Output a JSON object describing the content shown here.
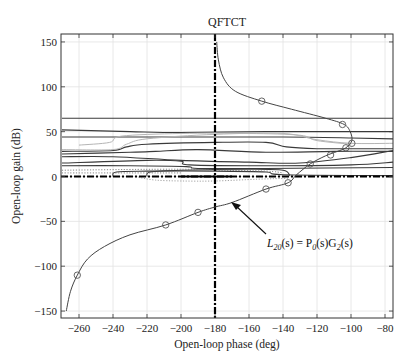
{
  "chart_data": {
    "type": "line",
    "title": "QFTCT",
    "xlabel": "Open-loop phase (deg)",
    "ylabel": "Open-loop gain (dB)",
    "xlim": [
      -270,
      -75
    ],
    "ylim": [
      -157,
      159
    ],
    "xticks": [
      -260,
      -240,
      -220,
      -200,
      -180,
      -160,
      -140,
      -120,
      -100,
      -80
    ],
    "yticks": [
      -150,
      -100,
      -50,
      0,
      50,
      100,
      150
    ],
    "grid": true,
    "reference_lines": {
      "vertical_phase": -180,
      "horizontal_gain": 0
    },
    "series": [
      {
        "name": "L20(s) = P0(s)G2(s)",
        "style": "solid-with-circle-markers",
        "points": [
          [
            -267.5,
            -150
          ],
          [
            -265,
            -128
          ],
          [
            -261,
            -110
          ],
          [
            -255,
            -92
          ],
          [
            -245,
            -78
          ],
          [
            -230,
            -65
          ],
          [
            -209,
            -54
          ],
          [
            -190,
            -40
          ],
          [
            -180,
            -34
          ],
          [
            -170,
            -29
          ],
          [
            -150,
            -14
          ],
          [
            -137,
            -7
          ],
          [
            -132,
            2
          ],
          [
            -124,
            14
          ],
          [
            -115,
            23
          ],
          [
            -108,
            28
          ],
          [
            -103,
            32
          ],
          [
            -99.5,
            40
          ],
          [
            -100.5,
            50
          ],
          [
            -104,
            58
          ],
          [
            -115,
            65
          ],
          [
            -135,
            75
          ],
          [
            -152.5,
            84
          ],
          [
            -168,
            95
          ],
          [
            -175,
            110
          ],
          [
            -178,
            130
          ],
          [
            -179,
            150
          ]
        ],
        "markers": [
          [
            -261,
            -110
          ],
          [
            -209,
            -54
          ],
          [
            -190,
            -40
          ],
          [
            -150,
            -14
          ],
          [
            -137,
            -7
          ],
          [
            -124,
            14
          ],
          [
            -112,
            24
          ],
          [
            -103,
            32
          ],
          [
            -99.5,
            37
          ],
          [
            -105,
            58
          ],
          [
            -152.5,
            84
          ]
        ]
      },
      {
        "name": "bound-1",
        "style": "solid",
        "points": [
          [
            -270,
            65
          ],
          [
            -75,
            65
          ]
        ]
      },
      {
        "name": "bound-2",
        "style": "solid",
        "points": [
          [
            -270,
            52
          ],
          [
            -230,
            50
          ],
          [
            -200,
            49
          ],
          [
            -150,
            50
          ],
          [
            -75,
            50
          ]
        ]
      },
      {
        "name": "bound-3",
        "style": "solid",
        "points": [
          [
            -270,
            44
          ],
          [
            -200,
            44
          ],
          [
            -140,
            44
          ],
          [
            -100,
            43
          ],
          [
            -75,
            42
          ]
        ]
      },
      {
        "name": "bound-4",
        "style": "solid",
        "points": [
          [
            -270,
            28
          ],
          [
            -240,
            29
          ],
          [
            -232,
            33
          ],
          [
            -220,
            36
          ],
          [
            -180,
            38
          ],
          [
            -150,
            38
          ],
          [
            -138,
            33
          ],
          [
            -120,
            31
          ],
          [
            -100,
            31
          ],
          [
            -75,
            31
          ]
        ]
      },
      {
        "name": "bound-5",
        "style": "solid",
        "points": [
          [
            -270,
            25
          ],
          [
            -230,
            27
          ],
          [
            -215,
            28
          ],
          [
            -190,
            30
          ],
          [
            -150,
            27
          ],
          [
            -110,
            28
          ],
          [
            -75,
            28
          ]
        ]
      },
      {
        "name": "bound-6",
        "style": "solid",
        "points": [
          [
            -270,
            22
          ],
          [
            -240,
            22
          ],
          [
            -200,
            18
          ],
          [
            -160,
            16
          ],
          [
            -130,
            15
          ],
          [
            -100,
            21
          ],
          [
            -75,
            29
          ]
        ]
      },
      {
        "name": "bound-7",
        "style": "solid",
        "points": [
          [
            -270,
            15
          ],
          [
            -220,
            18
          ],
          [
            -200,
            17
          ],
          [
            -195,
            13
          ],
          [
            -150,
            12
          ],
          [
            -100,
            13
          ],
          [
            -75,
            16
          ]
        ]
      },
      {
        "name": "bound-8",
        "style": "solid",
        "points": [
          [
            -270,
            12
          ],
          [
            -230,
            12
          ],
          [
            -197,
            11
          ],
          [
            -190,
            9
          ],
          [
            -150,
            9
          ],
          [
            -75,
            10
          ]
        ]
      },
      {
        "name": "bound-9",
        "style": "solid",
        "points": [
          [
            -240,
            0
          ],
          [
            -238,
            5
          ],
          [
            -220,
            6
          ],
          [
            -180,
            6
          ],
          [
            -150,
            5
          ],
          [
            -140,
            2
          ],
          [
            -75,
            1
          ]
        ]
      },
      {
        "name": "bound-10",
        "style": "solid",
        "points": [
          [
            -220,
            0
          ],
          [
            -218,
            5
          ],
          [
            -200,
            7
          ],
          [
            -160,
            8
          ],
          [
            -140,
            7
          ],
          [
            -136,
            1
          ]
        ]
      },
      {
        "name": "bound-11",
        "style": "light",
        "points": [
          [
            -270,
            30
          ],
          [
            -240,
            30
          ],
          [
            -232,
            36
          ],
          [
            -220,
            42
          ],
          [
            -180,
            47
          ],
          [
            -140,
            48
          ],
          [
            -120,
            41
          ],
          [
            -100,
            37
          ],
          [
            -75,
            37
          ]
        ]
      },
      {
        "name": "bound-12",
        "style": "light",
        "points": [
          [
            -260,
            35
          ],
          [
            -242,
            38
          ],
          [
            -235,
            45
          ],
          [
            -200,
            48
          ],
          [
            -160,
            48
          ],
          [
            -130,
            46
          ],
          [
            -120,
            40
          ],
          [
            -100,
            36
          ]
        ]
      },
      {
        "name": "bound-13",
        "style": "dotted",
        "points": [
          [
            -270,
            7
          ],
          [
            -220,
            8
          ],
          [
            -195,
            8
          ],
          [
            -180,
            7
          ],
          [
            -150,
            6
          ],
          [
            -140,
            4
          ]
        ]
      },
      {
        "name": "bound-14",
        "style": "dotted",
        "points": [
          [
            -270,
            4
          ],
          [
            -230,
            4
          ],
          [
            -200,
            4
          ]
        ]
      },
      {
        "name": "bound-15",
        "style": "dotted-light",
        "points": [
          [
            -225,
            -1
          ],
          [
            -215,
            -4
          ],
          [
            -200,
            -5
          ],
          [
            -180,
            -5
          ],
          [
            -155,
            -3
          ],
          [
            -137,
            -2
          ]
        ]
      }
    ],
    "annotations": [
      {
        "text_main": "L",
        "text_sub": "20",
        "text_rest": "(s) = P",
        "text_sub2": "0",
        "text_rest2": "(s)G",
        "text_sub3": "2",
        "text_rest3": "(s)",
        "arrow_from": [
          -150,
          -45
        ],
        "arrow_to": [
          -170,
          -30
        ]
      }
    ]
  }
}
